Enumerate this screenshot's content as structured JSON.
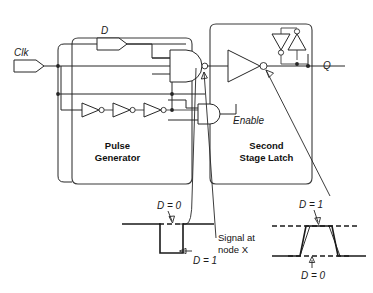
{
  "figure": {
    "signals": {
      "clk_label": "Clk",
      "d_label": "D",
      "q_label": "Q",
      "enable_label": "Enable"
    },
    "blocks": [
      {
        "id": "pulse-generator",
        "label": "Pulse\nGenerator",
        "line1": "Pulse",
        "line2": "Generator"
      },
      {
        "id": "second-stage-latch",
        "label": "Second\nStage Latch",
        "line1": "Second",
        "line2": "Stage Latch"
      }
    ],
    "annotations": {
      "node_x_line1": "Signal at",
      "node_x_line2": "node X"
    },
    "waveforms": [
      {
        "id": "node-x-waveform",
        "type": "negative-pulse",
        "high_label": "D = 0",
        "low_label": "D = 1"
      },
      {
        "id": "q-waveform",
        "type": "positive-pulse",
        "high_label": "D = 1",
        "low_label": "D = 0"
      }
    ],
    "gates": [
      {
        "id": "nand-gate",
        "type": "nand",
        "inputs": 3
      },
      {
        "id": "and-gate-enable",
        "type": "and",
        "inputs": 2
      },
      {
        "id": "inverter-chain",
        "type": "inverter",
        "count": 3
      },
      {
        "id": "output-inverter",
        "type": "inverter",
        "count": 1
      },
      {
        "id": "cross-coupled-inverters",
        "type": "inverter",
        "count": 2
      }
    ],
    "colors": {
      "ink": "#262626",
      "background": "#ffffff",
      "waveform": "#1a1a1a"
    }
  }
}
